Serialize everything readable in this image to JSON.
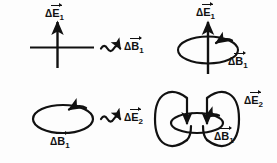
{
  "figure": {
    "background_color": "#fdfdfd",
    "stroke_color": "#111111"
  },
  "panels": [
    {
      "id": "top-left",
      "name": "changing-electric-field-panel",
      "description": "Vertical upward arrow crossed by a horizontal line representing a changing electric field vector",
      "label": {
        "symbol": "E",
        "delta": "Δ",
        "subscript": "1",
        "text": "ΔE⃗₁"
      }
    },
    {
      "id": "top-right",
      "name": "induced-magnetic-field-panel",
      "description": "Vertical upward arrow encircled by a horizontal loop representing the induced magnetic field",
      "labels": [
        {
          "symbol": "E",
          "delta": "Δ",
          "subscript": "1",
          "text": "ΔE⃗₁"
        },
        {
          "symbol": "B",
          "delta": "Δ",
          "subscript": "1",
          "text": "ΔB⃗₁"
        }
      ]
    },
    {
      "id": "bottom-left",
      "name": "changing-magnetic-field-panel",
      "description": "Single horizontal loop with counterclockwise arrowhead representing a changing magnetic field",
      "label": {
        "symbol": "B",
        "delta": "Δ",
        "subscript": "1",
        "text": "ΔB⃗₁"
      }
    },
    {
      "id": "bottom-right",
      "name": "induced-electric-field-panel",
      "description": "Two vertical loops with downward arrowheads threaded by a horizontal loop representing the induced electric field",
      "labels": [
        {
          "symbol": "E",
          "delta": "Δ",
          "subscript": "2",
          "text": "ΔE⃗₂"
        },
        {
          "symbol": "B",
          "delta": "Δ",
          "subscript": "1",
          "text": "ΔB⃗₁"
        }
      ]
    }
  ],
  "connectors": [
    {
      "id": "top-connector",
      "name": "wavy-arrow-induces-b",
      "style": "wavy-arrow-right",
      "result_label": {
        "delta": "Δ",
        "symbol": "B",
        "subscript": "1",
        "text": "ΔB⃗₁"
      }
    },
    {
      "id": "bottom-connector",
      "name": "wavy-arrow-induces-e",
      "style": "wavy-arrow-right",
      "result_label": {
        "delta": "Δ",
        "symbol": "E",
        "subscript": "2",
        "text": "ΔE⃗₂"
      }
    }
  ],
  "labels": {
    "delta": "Δ",
    "E": "E",
    "B": "B",
    "one": "1",
    "two": "2"
  }
}
